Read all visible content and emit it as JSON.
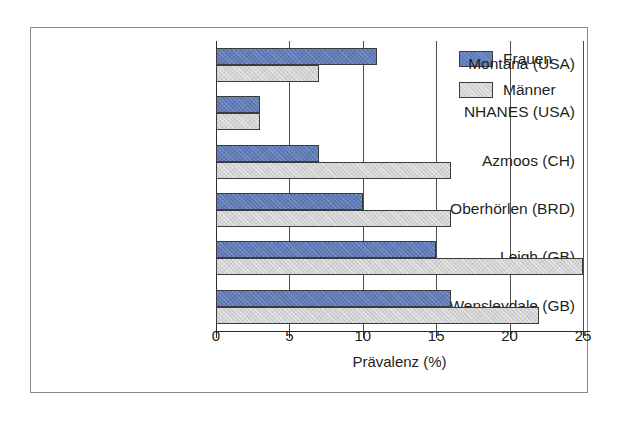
{
  "chart_data": {
    "type": "bar",
    "orientation": "horizontal",
    "title": "",
    "xlabel": "Prävalenz (%)",
    "ylabel": "",
    "xlim": [
      0,
      25
    ],
    "xticks": [
      0,
      5,
      10,
      15,
      20,
      25
    ],
    "xticklabels": [
      "0",
      "5",
      "10",
      "15",
      "20",
      "25"
    ],
    "grid": true,
    "grid_axis": "x",
    "legend_position": "upper right",
    "categories": [
      "Montana (USA)",
      "NHANES (USA)",
      "Azmoos (CH)",
      "Oberhörlen (BRD)",
      "Leigh (GB)",
      "Wensleydale (GB)"
    ],
    "series": [
      {
        "name": "Frauen",
        "color": "#5f7cb8",
        "values": [
          11,
          3,
          7,
          10,
          15,
          16
        ]
      },
      {
        "name": "Männer",
        "color": "#d2d2d2",
        "values": [
          7,
          3,
          16,
          16,
          25,
          22
        ]
      }
    ]
  },
  "legend": {
    "items": [
      {
        "label": "Frauen",
        "swatch": "frauen"
      },
      {
        "label": "Männer",
        "swatch": "maenner"
      }
    ]
  }
}
